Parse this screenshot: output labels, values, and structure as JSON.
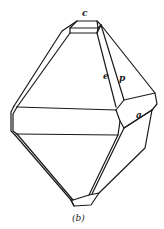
{
  "figure": {
    "caption": "(b)",
    "face_labels": {
      "c": "c",
      "e": "e",
      "p": "p",
      "a": "a"
    }
  }
}
